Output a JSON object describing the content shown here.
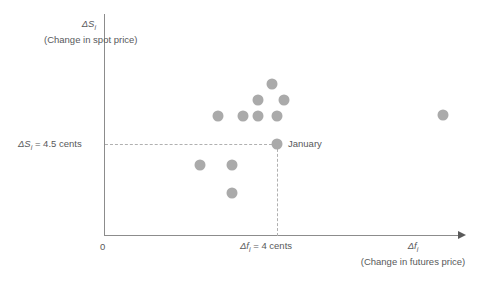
{
  "chart_data": {
    "type": "scatter",
    "title": "",
    "xlabel": "Δfᵢ (Change in futures price)",
    "ylabel": "ΔSᵢ (Change in spot price)",
    "axis": {
      "y_symbol": "ΔS",
      "y_subscript": "i",
      "y_description": "(Change in spot price)",
      "x_symbol": "Δf",
      "x_subscript": "i",
      "x_description": "(Change in futures price)",
      "origin_label": "0",
      "grid": false,
      "legend": "none"
    },
    "reference_lines": [
      {
        "name": "spot-price-threshold",
        "orientation": "horizontal",
        "label": "ΔS",
        "subscript": "i",
        "value_text": "= 4.5 cents",
        "full_label": "ΔSᵢ = 4.5 cents",
        "value": 4.5,
        "units": "cents",
        "style": "dashed"
      },
      {
        "name": "futures-price-threshold",
        "orientation": "vertical",
        "label": "Δf",
        "subscript": "i",
        "value_text": "= 4 cents",
        "full_label": "Δfᵢ = 4 cents",
        "value": 4,
        "units": "cents",
        "style": "dashed"
      }
    ],
    "annotations": [
      {
        "name": "january-point-label",
        "text": "January",
        "px": 277,
        "py": 144
      }
    ],
    "point_color": "#aaaaaa",
    "axis_color": "#8c8c8c",
    "text_color": "#58595b",
    "points": [
      {
        "px": 272,
        "py": 84
      },
      {
        "px": 258,
        "py": 100
      },
      {
        "px": 284,
        "py": 100
      },
      {
        "px": 218,
        "py": 116
      },
      {
        "px": 243,
        "py": 116
      },
      {
        "px": 258,
        "py": 116
      },
      {
        "px": 277,
        "py": 116
      },
      {
        "px": 443,
        "py": 115
      },
      {
        "px": 277,
        "py": 144
      },
      {
        "px": 200,
        "py": 165
      },
      {
        "px": 232,
        "py": 165
      },
      {
        "px": 232,
        "py": 193
      }
    ]
  }
}
